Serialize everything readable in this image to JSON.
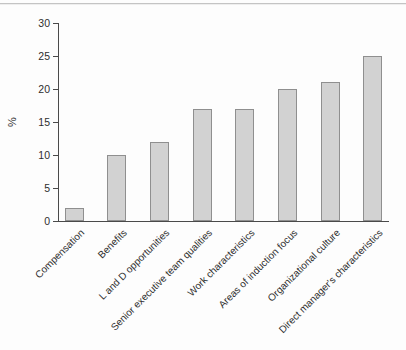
{
  "chart_data": {
    "type": "bar",
    "title": "",
    "xlabel": "",
    "ylabel": "%",
    "categories": [
      "Compensation",
      "Benefits",
      "L and D opportunities",
      "Senior executive team qualities",
      "Work characteristics",
      "Areas of induction focus",
      "Organizational culture",
      "Direct manager's characteristics"
    ],
    "values": [
      2,
      10,
      12,
      17,
      17,
      20,
      21,
      25
    ],
    "ylim": [
      0,
      30
    ],
    "yticks": [
      0,
      5,
      10,
      15,
      20,
      25,
      30
    ],
    "grid": false,
    "legend": "none",
    "x_label_rotation_deg": 45
  },
  "colors": {
    "bar_fill": "#d2d2d2",
    "bar_border": "#8f8f8f",
    "axis": "#4a4a4a",
    "text": "#2e2e2e",
    "top_rule": "#c4c4c4",
    "background": "#fdfdfd"
  }
}
